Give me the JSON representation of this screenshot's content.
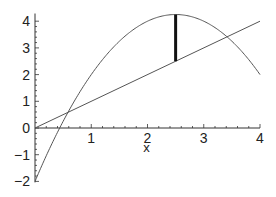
{
  "chart_data": {
    "type": "line",
    "title": "",
    "xlabel": "x",
    "ylabel": "",
    "xlim": [
      0,
      4
    ],
    "ylim": [
      -2,
      4.25
    ],
    "grid": false,
    "legend": null,
    "x_ticks": [
      "1",
      "2",
      "3",
      "4"
    ],
    "y_ticks": [
      "-2",
      "-1",
      "0",
      "1",
      "2",
      "3",
      "4"
    ],
    "y_tick_values": [
      -2,
      -1,
      0,
      1,
      2,
      3,
      4
    ],
    "x_tick_values": [
      1,
      2,
      3,
      4
    ],
    "origin_label": "0",
    "series": [
      {
        "name": "parabola",
        "expression": "y = -x^2 + 5x - 2",
        "x": [
          0,
          0.5,
          1,
          1.5,
          2,
          2.5,
          3,
          3.5,
          4
        ],
        "y": [
          -2,
          0.25,
          2,
          3.25,
          4,
          4.25,
          4,
          3.25,
          2
        ]
      },
      {
        "name": "line",
        "expression": "y = x",
        "x": [
          0,
          4
        ],
        "y": [
          0,
          4
        ]
      }
    ],
    "annotations": [
      {
        "type": "vertical-segment",
        "x": 2.5,
        "y_from": 2.5,
        "y_to": 4.25,
        "style": "thick"
      }
    ]
  },
  "colors": {
    "curve": "#555555",
    "axis": "#333333",
    "segment": "#111111"
  }
}
